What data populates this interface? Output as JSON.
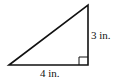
{
  "diagram": {
    "type": "right-triangle",
    "vertices": {
      "bottom_left": [
        9,
        65
      ],
      "top_right": [
        88,
        5
      ],
      "bottom_right": [
        88,
        65
      ]
    },
    "right_angle_at": "bottom_right",
    "labels": {
      "vertical_leg": "3 in.",
      "horizontal_leg": "4 in."
    },
    "stroke_color": "#111111",
    "background": "#ffffff"
  }
}
